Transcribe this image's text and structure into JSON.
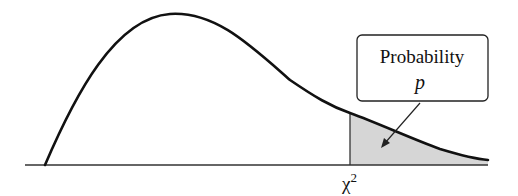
{
  "diagram": {
    "type": "chi-square distribution tail probability",
    "callout": {
      "line1": "Probability",
      "line2": "p"
    },
    "critical_value_label": "χ",
    "critical_value_superscript": "2",
    "colors": {
      "curve": "#111111",
      "axis": "#333333",
      "shaded_area": "#d6d6d6",
      "box_border": "#222222",
      "background": "#ffffff"
    }
  }
}
